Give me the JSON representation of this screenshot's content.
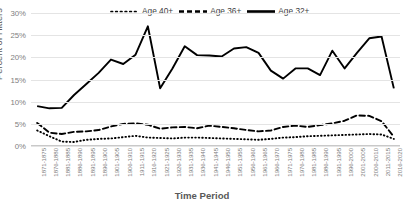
{
  "chart_data": {
    "type": "line",
    "title": "",
    "xlabel": "Time Period",
    "ylabel": "Percent of Hitters",
    "ylim": [
      0,
      30
    ],
    "yticks": [
      0,
      5,
      10,
      15,
      20,
      25,
      30
    ],
    "ytick_labels": [
      "0%",
      "5%",
      "10%",
      "15%",
      "20%",
      "25%",
      "30%"
    ],
    "grid": true,
    "legend_position": "top-center",
    "categories": [
      "1871-1875",
      "1876-1880",
      "1881-1885",
      "1886-1890",
      "1891-1895",
      "1896-1900",
      "1901-1905",
      "1906-1910",
      "1911-1915",
      "1916-1920",
      "1921-1925",
      "1926-1930",
      "1931-1935",
      "1936-1940",
      "1941-1945",
      "1946-1950",
      "1951-1955",
      "1956-1960",
      "1961-1965",
      "1966-1970",
      "1971-1975",
      "1976-1980",
      "1981-1985",
      "1986-1990",
      "1991-1995",
      "1996-2000",
      "2001-2005",
      "2006-2010",
      "2011-2015",
      "2016-2020"
    ],
    "series": [
      {
        "name": "Age 40+",
        "style": "dotted",
        "color": "#000000",
        "values": [
          3.5,
          2.2,
          1.0,
          0.9,
          1.4,
          1.6,
          1.7,
          2.0,
          2.3,
          1.9,
          1.8,
          1.7,
          1.9,
          1.9,
          1.8,
          1.7,
          1.6,
          1.5,
          1.4,
          1.6,
          1.9,
          2.0,
          2.2,
          2.3,
          2.4,
          2.5,
          2.6,
          2.7,
          2.6,
          1.6
        ]
      },
      {
        "name": "Age 36+",
        "style": "dashed",
        "color": "#000000",
        "values": [
          5.2,
          3.0,
          2.7,
          3.2,
          3.3,
          3.6,
          4.4,
          5.0,
          5.1,
          4.8,
          3.9,
          4.2,
          4.3,
          4.0,
          4.6,
          4.3,
          4.0,
          3.6,
          3.3,
          3.5,
          4.3,
          4.6,
          4.3,
          4.7,
          5.1,
          5.7,
          6.9,
          6.8,
          5.6,
          2.1
        ]
      },
      {
        "name": "Age 32+",
        "style": "solid",
        "color": "#000000",
        "values": [
          9.0,
          8.5,
          8.6,
          11.5,
          14.0,
          16.5,
          19.5,
          18.5,
          20.6,
          27.0,
          13.0,
          17.5,
          22.5,
          20.5,
          20.4,
          20.2,
          22.0,
          22.3,
          21.0,
          17.0,
          15.2,
          17.5,
          17.5,
          16.0,
          21.5,
          17.5,
          21.0,
          24.3,
          24.7,
          13.0
        ]
      }
    ]
  },
  "legend": {
    "items": [
      {
        "label": "Age 40+",
        "key": "dotted-line-key"
      },
      {
        "label": "Age 36+",
        "key": "dashed-line-key"
      },
      {
        "label": "Age 32+",
        "key": "solid-line-key"
      }
    ]
  }
}
